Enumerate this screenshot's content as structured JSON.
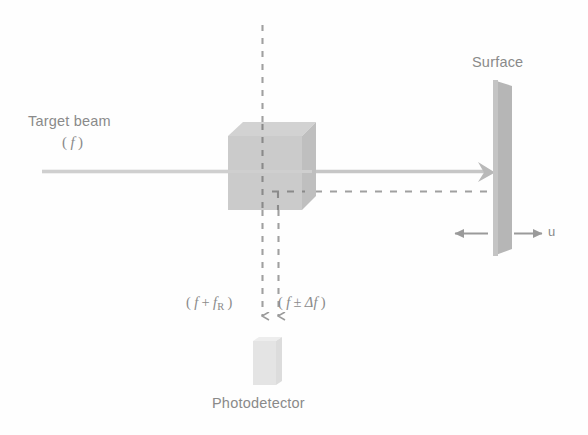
{
  "diagram": {
    "background_color": "#fefefe",
    "ink_color": "#8a8a8a",
    "labels": {
      "target_beam": "Target beam",
      "target_beam_frequency": "( f )",
      "surface": "Surface",
      "velocity": "u",
      "photodetector": "Photodetector",
      "reference_frequency": "( f + f_R )",
      "doppler_frequency": "( f ± Δf )"
    },
    "formula_parts": {
      "reference": {
        "open": "(",
        "f": "f",
        "operator": "+",
        "f2": "f",
        "subscript": "R",
        "close": ")"
      },
      "doppler": {
        "open": "(",
        "f": "f",
        "operator": "±",
        "delta": "Δ",
        "f2": "f",
        "close": ")"
      }
    },
    "components": [
      {
        "name": "beam-splitter-cube",
        "kind": "cube",
        "x": 228,
        "y": 122,
        "width": 88,
        "height": 88,
        "fill": "#c9c9c9",
        "top_fill": "#d8d8d8",
        "side_fill": "#bdbdbd"
      },
      {
        "name": "target-surface-bar",
        "kind": "bar",
        "x": 493,
        "y": 80,
        "width": 19,
        "height": 175,
        "fill": "#b4b4b4"
      },
      {
        "name": "photodetector-body",
        "kind": "bar",
        "x": 253,
        "y": 337,
        "width": 27,
        "height": 48,
        "fill": "#e6e6e6"
      }
    ],
    "beams": [
      {
        "name": "incoming-target-beam",
        "style": "solid",
        "color": "#c4c4c4",
        "x1": 42,
        "y1": 171,
        "x2": 230,
        "y2": 171
      },
      {
        "name": "outgoing-beam-to-surface",
        "style": "solid",
        "color": "#c4c4c4",
        "x1": 314,
        "y1": 171,
        "x2": 492,
        "y2": 171
      },
      {
        "name": "vertical-reference-dashed-top",
        "style": "dashed",
        "color": "#9a9a9a",
        "x1": 262,
        "y1": 25,
        "x2": 262,
        "y2": 122
      },
      {
        "name": "vertical-reference-dashed-bottom",
        "style": "dashed",
        "color": "#9a9a9a",
        "x1": 262,
        "y1": 210,
        "x2": 262,
        "y2": 322
      },
      {
        "name": "vertical-doppler-dashed-bottom",
        "style": "dashed",
        "color": "#9a9a9a",
        "x1": 278,
        "y1": 192,
        "x2": 278,
        "y2": 322
      },
      {
        "name": "horizontal-return-dashed",
        "style": "dashed",
        "color": "#9a9a9a",
        "x1": 278,
        "y1": 192,
        "x2": 500,
        "y2": 192
      }
    ],
    "arrows": [
      {
        "name": "velocity-arrow-left",
        "x1": 487,
        "y1": 233,
        "x2": 452,
        "y2": 233,
        "color": "#9a9a9a"
      },
      {
        "name": "velocity-arrow-right",
        "x1": 515,
        "y1": 233,
        "x2": 545,
        "y2": 233,
        "color": "#9a9a9a"
      }
    ]
  }
}
